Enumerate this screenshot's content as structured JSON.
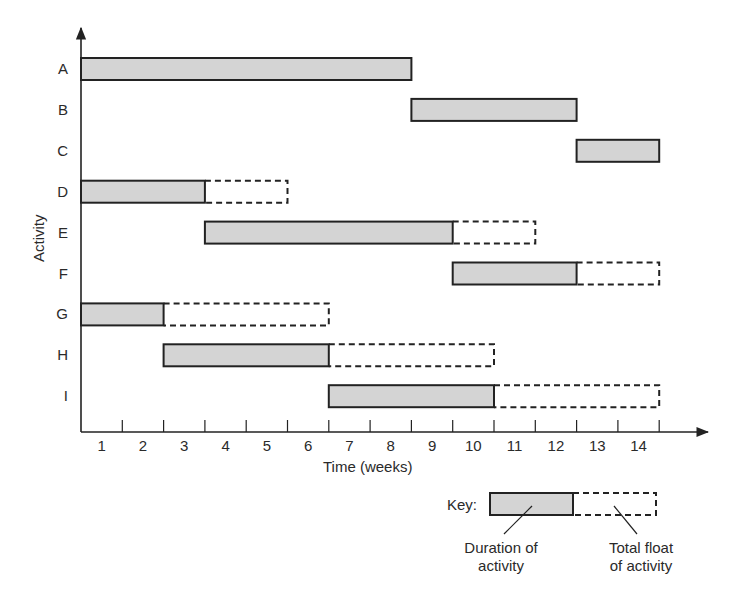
{
  "chart_data": {
    "type": "gantt",
    "title": "",
    "xlabel": "Time (weeks)",
    "ylabel": "Activity",
    "x_ticks": [
      "1",
      "2",
      "3",
      "4",
      "5",
      "6",
      "7",
      "8",
      "9",
      "10",
      "11",
      "12",
      "13",
      "14"
    ],
    "xlim": [
      0,
      14
    ],
    "grid": false,
    "categories": [
      "A",
      "B",
      "C",
      "D",
      "E",
      "F",
      "G",
      "H",
      "I"
    ],
    "series": [
      {
        "activity": "A",
        "start": 0,
        "duration": 8,
        "total_float": 0
      },
      {
        "activity": "B",
        "start": 8,
        "duration": 4,
        "total_float": 0
      },
      {
        "activity": "C",
        "start": 12,
        "duration": 2,
        "total_float": 0
      },
      {
        "activity": "D",
        "start": 0,
        "duration": 3,
        "total_float": 2
      },
      {
        "activity": "E",
        "start": 3,
        "duration": 6,
        "total_float": 2
      },
      {
        "activity": "F",
        "start": 9,
        "duration": 3,
        "total_float": 2
      },
      {
        "activity": "G",
        "start": 0,
        "duration": 2,
        "total_float": 4
      },
      {
        "activity": "H",
        "start": 2,
        "duration": 4,
        "total_float": 4
      },
      {
        "activity": "I",
        "start": 6,
        "duration": 4,
        "total_float": 4
      }
    ],
    "legend": {
      "title": "Key:",
      "entries": [
        {
          "label": "Duration of activity",
          "style": "solid grey bar"
        },
        {
          "label": "Total float of activity",
          "style": "dashed outline"
        }
      ],
      "position": "bottom-right"
    }
  },
  "key": {
    "title": "Key:",
    "duration_line1": "Duration of",
    "duration_line2": "activity",
    "float_line1": "Total float",
    "float_line2": "of activity"
  },
  "colors": {
    "bar_fill": "#d4d4d4",
    "stroke": "#222222"
  }
}
